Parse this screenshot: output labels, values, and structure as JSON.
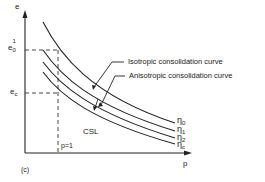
{
  "figure": {
    "panel_label": "(c)",
    "axes": {
      "y_label": "e",
      "x_label": "p"
    },
    "reference_lines": {
      "e0_label_base": "e",
      "e0_label_sub": "0",
      "e0_label_sup": "1",
      "ec_label_base": "e",
      "ec_label_sub": "c",
      "p1_label": "p=1"
    },
    "annotations": {
      "isotropic": "Isotropic consolidation curve",
      "anisotropic": "Anisotropic consolidation curve",
      "csl": "CSL"
    },
    "curves": [
      {
        "base": "η",
        "sub": "0"
      },
      {
        "base": "η",
        "sub": "1"
      },
      {
        "base": "η",
        "sub": "2"
      },
      {
        "base": "η",
        "sub": "c"
      }
    ]
  }
}
